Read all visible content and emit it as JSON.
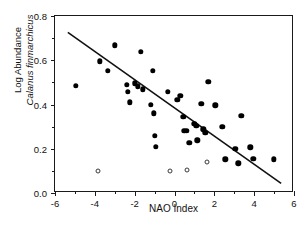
{
  "figure": {
    "x_axis_title": "NAO Index",
    "y_axis_title_line1": "Log Abundance",
    "y_axis_title_line2": "Calanus finmarchicus",
    "caption": ""
  },
  "chart_data": {
    "type": "scatter",
    "title": "",
    "xlabel": "NAO Index",
    "ylabel": "Log Abundance Calanus finmarchicus",
    "xlim": [
      -6,
      6
    ],
    "ylim": [
      0.0,
      0.8
    ],
    "xticks": [
      -6,
      -4,
      -2,
      0,
      2,
      4,
      6
    ],
    "yticks": [
      0.0,
      0.2,
      0.4,
      0.6,
      0.8
    ],
    "xtick_labels": [
      "-6",
      "-4",
      "-2",
      "0",
      "2",
      "4",
      "6"
    ],
    "ytick_labels": [
      "0.0",
      "0.2",
      "0.4",
      "0.6",
      "0.8"
    ],
    "minor_xticks": [
      -5,
      -3,
      -1,
      1,
      3,
      5
    ],
    "minor_yticks": [
      0.1,
      0.3,
      0.5,
      0.7
    ],
    "grid": false,
    "legend": null,
    "series": [
      {
        "name": "filled",
        "marker": "filled-circle",
        "color": "#000000",
        "points": [
          [
            -4.95,
            0.485
          ],
          [
            -3.75,
            0.595
          ],
          [
            -3.35,
            0.552
          ],
          [
            -3.0,
            0.668
          ],
          [
            -2.4,
            0.49
          ],
          [
            -2.35,
            0.458
          ],
          [
            -2.25,
            0.41
          ],
          [
            -2.0,
            0.495
          ],
          [
            -1.85,
            0.482
          ],
          [
            -1.7,
            0.638
          ],
          [
            -1.6,
            0.468
          ],
          [
            -1.2,
            0.398
          ],
          [
            -1.1,
            0.552
          ],
          [
            -1.05,
            0.36
          ],
          [
            -1.0,
            0.258
          ],
          [
            -0.95,
            0.208
          ],
          [
            -0.35,
            0.458
          ],
          [
            0.15,
            0.42
          ],
          [
            0.3,
            0.44
          ],
          [
            0.45,
            0.345
          ],
          [
            0.5,
            0.282
          ],
          [
            0.62,
            0.28
          ],
          [
            0.75,
            0.228
          ],
          [
            1.0,
            0.312
          ],
          [
            1.1,
            0.305
          ],
          [
            1.15,
            0.238
          ],
          [
            1.35,
            0.402
          ],
          [
            1.45,
            0.288
          ],
          [
            1.55,
            0.272
          ],
          [
            1.7,
            0.502
          ],
          [
            2.05,
            0.396
          ],
          [
            2.4,
            0.3
          ],
          [
            2.55,
            0.152
          ],
          [
            3.05,
            0.2
          ],
          [
            3.2,
            0.135
          ],
          [
            3.35,
            0.348
          ],
          [
            3.8,
            0.206
          ],
          [
            3.95,
            0.155
          ],
          [
            5.0,
            0.152
          ]
        ]
      },
      {
        "name": "open",
        "marker": "open-circle",
        "color": "#3a3a3a",
        "points": [
          [
            -3.85,
            0.098
          ],
          [
            -0.25,
            0.098
          ],
          [
            0.65,
            0.105
          ],
          [
            1.65,
            0.138
          ]
        ]
      }
    ],
    "fit_line": {
      "type": "linear-regression",
      "x_start": -5.35,
      "y_start": 0.725,
      "x_end": 5.45,
      "y_end": 0.035,
      "color": "#111111"
    }
  }
}
